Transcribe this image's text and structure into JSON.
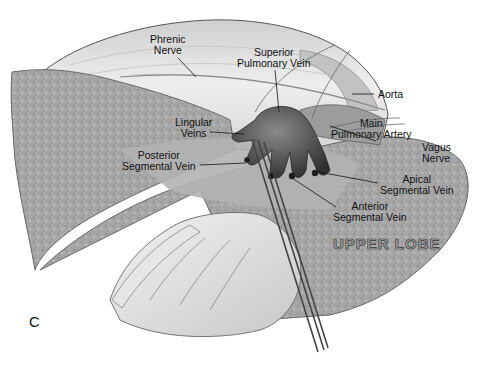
{
  "figure": {
    "panel_letter": "C",
    "region_label": "UPPER LOBE",
    "labels": [
      {
        "id": "phrenic-nerve",
        "lines": [
          "Phrenic",
          "Nerve"
        ]
      },
      {
        "id": "superior-pulmonary-vein",
        "lines": [
          "Superior",
          "Pulmonary Vein"
        ]
      },
      {
        "id": "aorta",
        "lines": [
          "Aorta"
        ]
      },
      {
        "id": "main-pulmonary-artery",
        "lines": [
          "Main",
          "Pulmonary Artery"
        ]
      },
      {
        "id": "lingular-veins",
        "lines": [
          "Lingular",
          "Veins"
        ]
      },
      {
        "id": "vagus-nerve",
        "lines": [
          "Vagus",
          "Nerve"
        ]
      },
      {
        "id": "posterior-segmental-vein",
        "lines": [
          "Posterior",
          "Segmental Vein"
        ]
      },
      {
        "id": "apical-segmental-vein",
        "lines": [
          "Apical",
          "Segmental Vein"
        ]
      },
      {
        "id": "anterior-segmental-vein",
        "lines": [
          "Anterior",
          "Segmental Vein"
        ]
      }
    ]
  },
  "colors": {
    "background": "#ffffff",
    "lung_tissue": "#a9a9a9",
    "pleura": "#dcdcdc",
    "vein": "#4a4a4a",
    "text": "#111111"
  }
}
